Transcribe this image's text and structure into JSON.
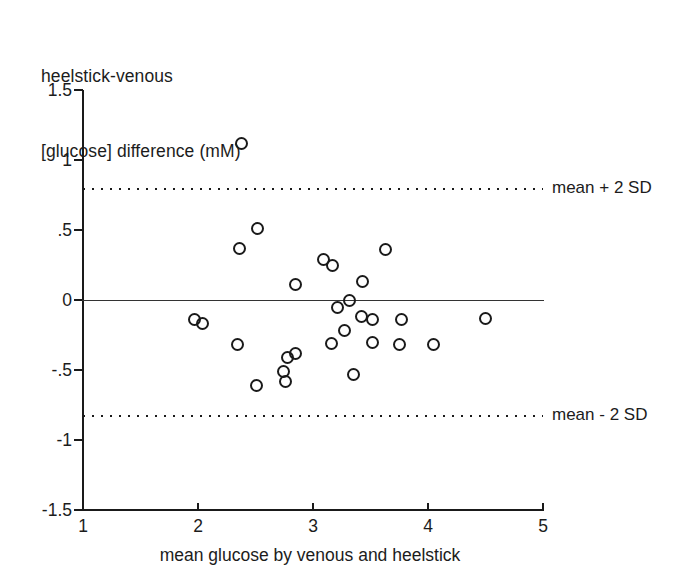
{
  "chart_data": {
    "type": "scatter",
    "title": "heelstick-venous\n[glucose] difference (mM)",
    "title_lines": [
      "heelstick-venous",
      "[glucose] difference (mM)"
    ],
    "xlabel": "mean glucose by venous and heelstick",
    "ylabel": "heelstick-venous [glucose] difference (mM)",
    "xlim": [
      1,
      5
    ],
    "ylim": [
      -1.5,
      1.5
    ],
    "xticks": [
      1,
      2,
      3,
      4,
      5
    ],
    "xtick_labels": [
      "1",
      "2",
      "3",
      "4",
      "5"
    ],
    "yticks": [
      1.5,
      1,
      0.5,
      0,
      -0.5,
      -1,
      -1.5
    ],
    "ytick_labels": [
      "1.5",
      "1",
      ".5",
      "0",
      "-.5",
      "-1",
      "-1.5"
    ],
    "grid": false,
    "legend": null,
    "marker": "open-circle",
    "reference_lines": [
      {
        "name": "mean",
        "y": 0,
        "style": "solid",
        "label": ""
      },
      {
        "name": "mean + 2 SD",
        "y": 0.8,
        "style": "dotted",
        "label": "mean + 2 SD"
      },
      {
        "name": "mean - 2 SD",
        "y": -0.82,
        "style": "dotted",
        "label": "mean - 2 SD"
      }
    ],
    "points": [
      {
        "x": 2.38,
        "y": 1.12
      },
      {
        "x": 2.52,
        "y": 0.51
      },
      {
        "x": 2.36,
        "y": 0.37
      },
      {
        "x": 3.63,
        "y": 0.36
      },
      {
        "x": 3.09,
        "y": 0.29
      },
      {
        "x": 3.17,
        "y": 0.25
      },
      {
        "x": 3.43,
        "y": 0.13
      },
      {
        "x": 2.85,
        "y": 0.11
      },
      {
        "x": 3.32,
        "y": 0.0
      },
      {
        "x": 3.21,
        "y": -0.05
      },
      {
        "x": 3.42,
        "y": -0.12
      },
      {
        "x": 4.5,
        "y": -0.13
      },
      {
        "x": 1.97,
        "y": -0.14
      },
      {
        "x": 3.77,
        "y": -0.14
      },
      {
        "x": 2.04,
        "y": -0.17
      },
      {
        "x": 3.27,
        "y": -0.22
      },
      {
        "x": 3.52,
        "y": -0.14
      },
      {
        "x": 2.34,
        "y": -0.32
      },
      {
        "x": 3.16,
        "y": -0.31
      },
      {
        "x": 3.75,
        "y": -0.32
      },
      {
        "x": 3.52,
        "y": -0.3
      },
      {
        "x": 2.85,
        "y": -0.38
      },
      {
        "x": 2.78,
        "y": -0.41
      },
      {
        "x": 3.35,
        "y": -0.53
      },
      {
        "x": 2.74,
        "y": -0.51
      },
      {
        "x": 2.76,
        "y": -0.58
      },
      {
        "x": 2.51,
        "y": -0.61
      },
      {
        "x": 4.05,
        "y": -0.32
      }
    ]
  },
  "colors": {
    "ink": "#1a1a1a",
    "background": "#ffffff"
  }
}
